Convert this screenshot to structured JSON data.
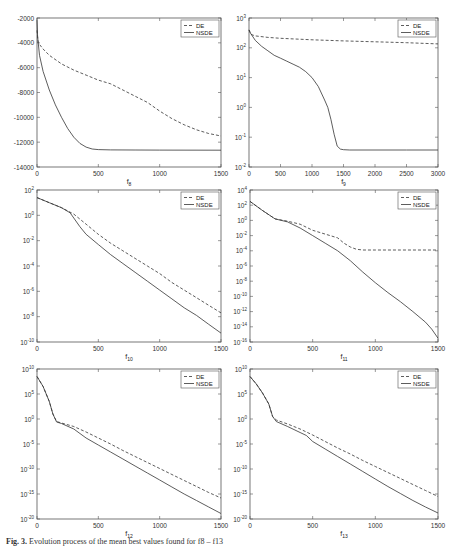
{
  "figure": {
    "caption_label": "Fig. 3.",
    "caption_text": "Evolution process of the mean best values found for f8 – f13"
  },
  "chart_data": [
    {
      "id": "f8",
      "type": "line",
      "xlabel": "f",
      "xlabel_sub": "8",
      "yscale": "linear",
      "xlim": [
        0,
        1500
      ],
      "ylim": [
        -14000,
        -2000
      ],
      "xticks": [
        0,
        500,
        1000,
        1500
      ],
      "yticks": [
        -2000,
        -4000,
        -6000,
        -8000,
        -10000,
        -12000,
        -14000
      ],
      "ytick_labels": [
        "-2000",
        "-4000",
        "-6000",
        "-8000",
        "-10000",
        "-12000",
        "-14000"
      ],
      "box": [
        37,
        18,
        221,
        167
      ],
      "legend": [
        "DE",
        "NSDE"
      ],
      "legend_position": "upper right",
      "series": [
        {
          "name": "DE",
          "style": "dashed",
          "x": [
            0,
            10,
            50,
            100,
            200,
            300,
            400,
            500,
            600,
            700,
            800,
            900,
            1000,
            1100,
            1200,
            1300,
            1400,
            1500
          ],
          "y": [
            -3000,
            -4000,
            -4500,
            -5000,
            -5700,
            -6200,
            -6600,
            -7000,
            -7300,
            -7800,
            -8300,
            -8800,
            -9500,
            -10100,
            -10600,
            -11000,
            -11300,
            -11500
          ]
        },
        {
          "name": "NSDE",
          "style": "solid",
          "x": [
            0,
            5,
            20,
            50,
            100,
            150,
            200,
            250,
            300,
            350,
            400,
            450,
            500,
            600,
            800,
            1000,
            1500
          ],
          "y": [
            -2200,
            -3500,
            -5000,
            -6300,
            -7800,
            -9000,
            -10000,
            -10900,
            -11600,
            -12100,
            -12400,
            -12550,
            -12600,
            -12620,
            -12630,
            -12640,
            -12650
          ]
        }
      ]
    },
    {
      "id": "f9",
      "type": "line",
      "xlabel": "f",
      "xlabel_sub": "9",
      "yscale": "log",
      "xlim": [
        0,
        3000
      ],
      "ylim_exp": [
        -2,
        3
      ],
      "xticks": [
        0,
        500,
        1000,
        1500,
        2000,
        2500,
        3000
      ],
      "ytick_exps": [
        3,
        2,
        1,
        0,
        -1,
        -2
      ],
      "box": [
        249,
        18,
        438,
        167
      ],
      "legend": [
        "DE",
        "NSDE"
      ],
      "legend_position": "upper right",
      "series": [
        {
          "name": "DE",
          "style": "dashed",
          "x": [
            0,
            30,
            100,
            300,
            500,
            1000,
            1500,
            2000,
            2500,
            3000
          ],
          "y_exp": [
            2.6,
            2.45,
            2.4,
            2.35,
            2.32,
            2.27,
            2.23,
            2.2,
            2.17,
            2.13
          ]
        },
        {
          "name": "NSDE",
          "style": "solid",
          "x": [
            0,
            20,
            100,
            200,
            300,
            400,
            500,
            600,
            700,
            800,
            900,
            1000,
            1100,
            1200,
            1250,
            1300,
            1350,
            1400,
            1450,
            1500,
            1600,
            2000,
            2500,
            3000
          ],
          "y_exp": [
            2.6,
            2.5,
            2.25,
            2.05,
            1.9,
            1.75,
            1.65,
            1.55,
            1.45,
            1.35,
            1.2,
            1.0,
            0.7,
            0.25,
            0.0,
            -0.4,
            -0.9,
            -1.3,
            -1.4,
            -1.42,
            -1.43,
            -1.43,
            -1.43,
            -1.43
          ]
        }
      ]
    },
    {
      "id": "f10",
      "type": "line",
      "xlabel": "f",
      "xlabel_sub": "10",
      "yscale": "log",
      "xlim": [
        0,
        1500
      ],
      "ylim_exp": [
        -10,
        2
      ],
      "xticks": [
        0,
        500,
        1000,
        1500
      ],
      "ytick_exps": [
        2,
        0,
        -2,
        -4,
        -6,
        -8,
        -10
      ],
      "box": [
        37,
        190,
        221,
        342
      ],
      "legend": [
        "DE",
        "NSDE"
      ],
      "legend_position": "upper right",
      "series": [
        {
          "name": "DE",
          "style": "dashed",
          "x": [
            0,
            100,
            200,
            300,
            400,
            500,
            600,
            700,
            800,
            900,
            1000,
            1100,
            1200,
            1300,
            1400,
            1500
          ],
          "y_exp": [
            1.4,
            1.0,
            0.6,
            0.1,
            -0.7,
            -1.5,
            -2.2,
            -2.8,
            -3.4,
            -4.0,
            -4.6,
            -5.3,
            -5.9,
            -6.5,
            -7.1,
            -7.7
          ]
        },
        {
          "name": "NSDE",
          "style": "solid",
          "x": [
            0,
            100,
            200,
            270,
            350,
            400,
            500,
            600,
            700,
            800,
            900,
            1000,
            1100,
            1200,
            1300,
            1400,
            1500
          ],
          "y_exp": [
            1.4,
            1.0,
            0.6,
            0.2,
            -0.9,
            -1.5,
            -2.3,
            -3.1,
            -3.8,
            -4.5,
            -5.2,
            -5.9,
            -6.6,
            -7.3,
            -7.9,
            -8.6,
            -9.3
          ]
        }
      ]
    },
    {
      "id": "f11",
      "type": "line",
      "xlabel": "f",
      "xlabel_sub": "11",
      "yscale": "log",
      "xlim": [
        0,
        1500
      ],
      "ylim_exp": [
        -16,
        4
      ],
      "xticks": [
        0,
        500,
        1000,
        1500
      ],
      "ytick_exps": [
        4,
        2,
        0,
        -2,
        -4,
        -6,
        -8,
        -10,
        -12,
        -14,
        -16
      ],
      "box": [
        250,
        190,
        438,
        342
      ],
      "legend": [
        "DE",
        "NSDE"
      ],
      "legend_position": "upper right",
      "series": [
        {
          "name": "DE",
          "style": "dashed",
          "x": [
            0,
            100,
            200,
            300,
            400,
            500,
            600,
            700,
            750,
            800,
            850,
            900,
            1000,
            1200,
            1500
          ],
          "y_exp": [
            2.5,
            1.3,
            0.2,
            -0.1,
            -0.5,
            -1.3,
            -1.8,
            -2.3,
            -3.0,
            -3.5,
            -3.8,
            -3.9,
            -3.9,
            -3.9,
            -3.9
          ]
        },
        {
          "name": "NSDE",
          "style": "solid",
          "x": [
            0,
            100,
            200,
            300,
            400,
            500,
            600,
            700,
            800,
            900,
            1000,
            1100,
            1200,
            1300,
            1400,
            1450,
            1500
          ],
          "y_exp": [
            2.5,
            1.3,
            0.2,
            -0.2,
            -1.0,
            -2.0,
            -3.0,
            -4.0,
            -5.3,
            -6.8,
            -8.2,
            -9.5,
            -10.7,
            -12.0,
            -13.4,
            -14.3,
            -15.5
          ]
        }
      ]
    },
    {
      "id": "f12",
      "type": "line",
      "xlabel": "f",
      "xlabel_sub": "12",
      "yscale": "log",
      "xlim": [
        0,
        1500
      ],
      "ylim_exp": [
        -20,
        10
      ],
      "xticks": [
        0,
        500,
        1000,
        1500
      ],
      "ytick_exps": [
        10,
        5,
        0,
        -5,
        -10,
        -15,
        -20
      ],
      "box": [
        37,
        369,
        221,
        519
      ],
      "legend": [
        "DE",
        "NSDE"
      ],
      "legend_position": "upper right",
      "series": [
        {
          "name": "DE",
          "style": "dashed",
          "x": [
            0,
            50,
            100,
            130,
            160,
            200,
            300,
            400,
            500,
            600,
            700,
            800,
            900,
            1000,
            1100,
            1200,
            1300,
            1400,
            1500
          ],
          "y_exp": [
            8.5,
            6.5,
            3.5,
            1.0,
            -0.5,
            -0.8,
            -1.5,
            -2.6,
            -3.8,
            -5.0,
            -6.3,
            -7.5,
            -8.7,
            -9.9,
            -11.1,
            -12.3,
            -13.5,
            -14.7,
            -15.8
          ]
        },
        {
          "name": "NSDE",
          "style": "solid",
          "x": [
            0,
            50,
            100,
            130,
            160,
            200,
            300,
            400,
            500,
            600,
            700,
            800,
            900,
            1000,
            1100,
            1200,
            1300,
            1400,
            1500
          ],
          "y_exp": [
            8.5,
            6.5,
            3.5,
            1.0,
            -0.6,
            -0.9,
            -2.0,
            -3.8,
            -5.2,
            -6.6,
            -8.0,
            -9.4,
            -10.8,
            -12.2,
            -13.6,
            -15.0,
            -16.3,
            -17.6,
            -18.9
          ]
        }
      ]
    },
    {
      "id": "f13",
      "type": "line",
      "xlabel": "f",
      "xlabel_sub": "13",
      "yscale": "log",
      "xlim": [
        0,
        1500
      ],
      "ylim_exp": [
        -20,
        10
      ],
      "xticks": [
        0,
        500,
        1000,
        1500
      ],
      "ytick_exps": [
        10,
        5,
        0,
        -5,
        -10,
        -15,
        -20
      ],
      "box": [
        250,
        369,
        438,
        519
      ],
      "legend": [
        "DE",
        "NSDE"
      ],
      "legend_position": "upper right",
      "series": [
        {
          "name": "DE",
          "style": "dashed",
          "x": [
            0,
            50,
            100,
            150,
            180,
            210,
            300,
            400,
            500,
            600,
            700,
            800,
            900,
            1000,
            1100,
            1200,
            1300,
            1400,
            1500
          ],
          "y_exp": [
            8.5,
            7.0,
            5.2,
            3.0,
            0.5,
            -0.2,
            -1.0,
            -2.0,
            -3.2,
            -4.5,
            -5.8,
            -7.0,
            -8.3,
            -9.5,
            -10.7,
            -11.9,
            -13.1,
            -14.3,
            -15.5
          ]
        },
        {
          "name": "NSDE",
          "style": "solid",
          "x": [
            0,
            50,
            100,
            150,
            180,
            210,
            300,
            400,
            450,
            500,
            600,
            700,
            800,
            900,
            1000,
            1100,
            1200,
            1300,
            1400,
            1500
          ],
          "y_exp": [
            8.5,
            7.0,
            5.2,
            3.0,
            0.5,
            -0.5,
            -1.5,
            -2.7,
            -3.3,
            -4.5,
            -6.0,
            -7.5,
            -9.0,
            -10.5,
            -12.0,
            -13.5,
            -14.9,
            -16.3,
            -17.6,
            -18.8
          ]
        }
      ]
    }
  ]
}
